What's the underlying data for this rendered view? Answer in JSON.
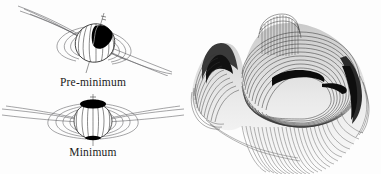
{
  "figure": {
    "background_color": "#fdfdfd",
    "line_color": "#4a4a4a",
    "dark_fill_color": "#000000"
  },
  "panels": {
    "left": {
      "name": "magnetic-field-diagrams",
      "diagrams": [
        {
          "label": "Pre-minimum",
          "state": "tilted",
          "description": "Tilted star with dark polar cap and inclined magnetic field lines",
          "tilt_degrees": -28,
          "cap_position": "upper-right"
        },
        {
          "label": "Minimum",
          "state": "aligned",
          "description": "Upright star with dark polar cap and symmetric horizontal field lines",
          "tilt_degrees": 0,
          "cap_position": "top"
        }
      ]
    },
    "right": {
      "name": "three-dimensional-surface-plot",
      "description": "Dense contour wireframe of a folded saddle surface",
      "line_count": 58,
      "shading": "hatched"
    }
  }
}
